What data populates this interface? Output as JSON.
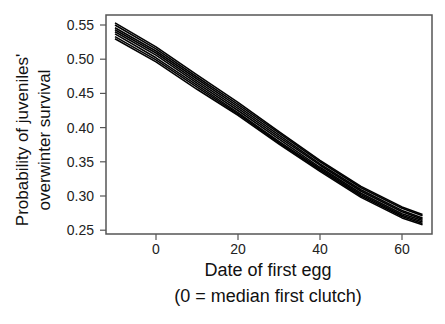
{
  "chart_data": {
    "type": "line",
    "title": "",
    "xlabel": [
      "Date of first egg",
      "(0 = median first clutch)"
    ],
    "ylabel": [
      "Probability of juveniles'",
      "overwinter survival"
    ],
    "xlim": [
      -12,
      67
    ],
    "ylim": [
      0.245,
      0.56
    ],
    "x_ticks": [
      0,
      20,
      40,
      60
    ],
    "x_tick_labels": [
      "0",
      "20",
      "40",
      "60"
    ],
    "y_ticks": [
      0.25,
      0.3,
      0.35,
      0.4,
      0.45,
      0.5,
      0.55
    ],
    "y_tick_labels": [
      "0.25",
      "0.30",
      "0.35",
      "0.40",
      "0.45",
      "0.50",
      "0.55"
    ],
    "grid": false,
    "legend": null,
    "line_color": "#000000",
    "x": [
      -10,
      0,
      10,
      20,
      30,
      40,
      50,
      60,
      65
    ],
    "series": [
      {
        "name": "line 1",
        "values": [
          0.553,
          0.518,
          0.477,
          0.437,
          0.394,
          0.352,
          0.314,
          0.284,
          0.273
        ]
      },
      {
        "name": "line 2",
        "values": [
          0.55,
          0.515,
          0.474,
          0.434,
          0.392,
          0.35,
          0.312,
          0.282,
          0.271
        ]
      },
      {
        "name": "line 3",
        "values": [
          0.546,
          0.512,
          0.471,
          0.431,
          0.389,
          0.347,
          0.309,
          0.279,
          0.268
        ]
      },
      {
        "name": "line 4",
        "values": [
          0.543,
          0.509,
          0.468,
          0.428,
          0.386,
          0.345,
          0.307,
          0.277,
          0.266
        ]
      },
      {
        "name": "line 5",
        "values": [
          0.54,
          0.506,
          0.465,
          0.425,
          0.383,
          0.342,
          0.304,
          0.274,
          0.264
        ]
      },
      {
        "name": "line 6",
        "values": [
          0.537,
          0.502,
          0.462,
          0.422,
          0.38,
          0.34,
          0.302,
          0.272,
          0.262
        ]
      },
      {
        "name": "line 7",
        "values": [
          0.533,
          0.499,
          0.459,
          0.42,
          0.378,
          0.338,
          0.3,
          0.27,
          0.26
        ]
      },
      {
        "name": "line 8",
        "values": [
          0.53,
          0.496,
          0.456,
          0.418,
          0.376,
          0.336,
          0.298,
          0.268,
          0.258
        ]
      }
    ]
  }
}
